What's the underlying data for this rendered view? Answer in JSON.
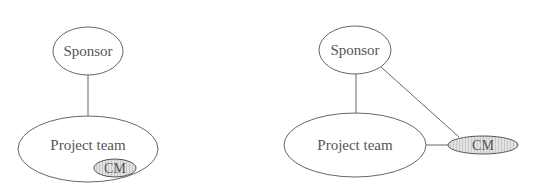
{
  "diagrams": [
    {
      "id": "left",
      "description": "CM embedded within the project team",
      "nodes": {
        "sponsor": {
          "label": "Sponsor",
          "cx": 88,
          "cy": 51,
          "rx": 35,
          "ry": 24
        },
        "project_team": {
          "label": "Project team",
          "cx": 88,
          "cy": 149,
          "rx": 70,
          "ry": 33,
          "label_y": 144
        },
        "cm": {
          "label": "CM",
          "cx": 115,
          "cy": 168,
          "rx": 21,
          "ry": 9,
          "fill": "#d9d9d9"
        }
      },
      "edges": [
        {
          "from": "Sponsor",
          "to": "Project team"
        }
      ]
    },
    {
      "id": "right",
      "description": "CM separate, linked to both sponsor and project team",
      "nodes": {
        "sponsor": {
          "label": "Sponsor",
          "cx": 355,
          "cy": 50,
          "rx": 36,
          "ry": 24
        },
        "project_team": {
          "label": "Project team",
          "cx": 355,
          "cy": 145,
          "rx": 71,
          "ry": 32,
          "label_y": 145
        },
        "cm": {
          "label": "CM",
          "cx": 483,
          "cy": 145,
          "rx": 35,
          "ry": 9,
          "fill": "#d9d9d9"
        }
      },
      "edges": [
        {
          "from": "Sponsor",
          "to": "Project team"
        },
        {
          "from": "Sponsor",
          "to": "CM"
        },
        {
          "from": "Project team",
          "to": "CM"
        }
      ]
    }
  ],
  "colors": {
    "stroke": "#555555",
    "text": "#555555",
    "cm_fill": "#d9d9d9",
    "background": "#ffffff"
  }
}
